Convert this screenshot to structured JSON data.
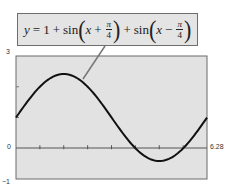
{
  "chart_data": {
    "type": "line",
    "equation_parts": {
      "lhs": "y",
      "eq": "=",
      "const": "1",
      "plus1": "+",
      "sin1": "sin",
      "x1": "x",
      "op1": "+",
      "pi1": "π",
      "den1": "4",
      "plus2": "+",
      "sin2": "sin",
      "x2": "x",
      "op2": "−",
      "pi2": "π",
      "den2": "4"
    },
    "xlabel": "",
    "ylabel": "",
    "xlim": [
      0,
      6.28
    ],
    "ylim": [
      -1,
      3
    ],
    "x_tick_labels": {
      "min": "0",
      "max": "6.28"
    },
    "y_tick_labels": {
      "max": "3",
      "min": "−1"
    },
    "x_tick_step": 0.785,
    "y_tick_step": 1,
    "grid": false,
    "series": [
      {
        "name": "y = 1 + sin(x + π/4) + sin(x − π/4)",
        "x": [
          0,
          0.785,
          1.571,
          2.356,
          3.142,
          3.927,
          4.712,
          5.498,
          6.28
        ],
        "values": [
          1.0,
          2.0,
          2.414,
          2.0,
          1.0,
          0.0,
          -0.414,
          0.0,
          1.0
        ]
      }
    ],
    "colors": {
      "plot_background": "#e2e2e2",
      "curve": "#111111",
      "axis": "#555555",
      "callout_background": "#e4e4e4",
      "callout_border": "#6e6e6e",
      "leader_line": "#777777"
    }
  }
}
